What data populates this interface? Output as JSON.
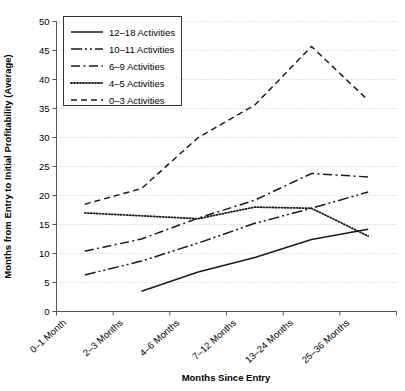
{
  "chart_data": {
    "type": "line",
    "title": "",
    "xlabel": "Months Since Entry",
    "ylabel": "Months from Entry to Initial Profitability (Average)",
    "categories": [
      "0–1 Month",
      "2–3 Months",
      "4–6 Months",
      "7–12 Months",
      "13–24 Months",
      "25–36 Months"
    ],
    "ylim": [
      0,
      50
    ],
    "yticks": [
      0,
      5,
      10,
      15,
      20,
      25,
      30,
      35,
      40,
      45,
      50
    ],
    "ytick_labels": [
      "0",
      "5",
      "10",
      "15",
      "20",
      "25",
      "30",
      "35",
      "40",
      "45",
      "50"
    ],
    "grid": "horizontal-dotted",
    "legend_position": "upper-left",
    "series": [
      {
        "name": "12–18 Activities",
        "style": "solid",
        "color": "#1a1a1a",
        "values": [
          null,
          3.5,
          6.8,
          9.3,
          12.4,
          14.2
        ]
      },
      {
        "name": "10–11 Activities",
        "style": "dash-dot-dot",
        "color": "#1a1a1a",
        "values": [
          6.3,
          8.7,
          11.8,
          15.2,
          17.8,
          20.6
        ]
      },
      {
        "name": "6–9 Activities",
        "style": "dash-dot",
        "color": "#1a1a1a",
        "values": [
          10.4,
          12.5,
          16.1,
          19.2,
          23.8,
          23.2
        ]
      },
      {
        "name": "4–5 Activities",
        "style": "dotted",
        "color": "#1a1a1a",
        "values": [
          17.0,
          16.5,
          16.0,
          18.0,
          17.8,
          13.0
        ]
      },
      {
        "name": "0–3 Activities",
        "style": "dashed",
        "color": "#1a1a1a",
        "values": [
          18.5,
          21.2,
          30.0,
          35.6,
          45.7,
          36.4
        ]
      }
    ]
  }
}
